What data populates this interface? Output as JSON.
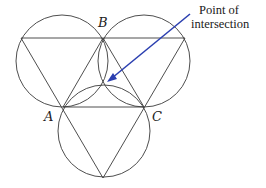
{
  "diagram": {
    "labels": {
      "A": "A",
      "B": "B",
      "C": "C"
    },
    "annotation": {
      "line1": "Point of",
      "line2": "intersection"
    },
    "colors": {
      "lines": "#3a3a3a",
      "arrow": "#2b3fb0",
      "background": "#ffffff"
    },
    "points": {
      "A": [
        63,
        107
      ],
      "B": [
        103,
        38
      ],
      "C": [
        144,
        107
      ],
      "outer_top_left": [
        21,
        38
      ],
      "outer_top_right": [
        185,
        38
      ],
      "outer_bottom": [
        103,
        178
      ],
      "intersection": [
        104,
        84
      ]
    },
    "circles": [
      {
        "name": "top-left",
        "cx": 62,
        "cy": 61,
        "r": 46
      },
      {
        "name": "top-right",
        "cx": 144,
        "cy": 61,
        "r": 46
      },
      {
        "name": "bottom",
        "cx": 104,
        "cy": 131,
        "r": 46
      }
    ]
  }
}
